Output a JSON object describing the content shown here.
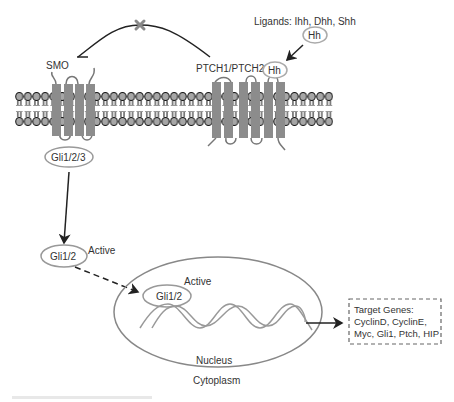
{
  "diagram": {
    "labels": {
      "smo": "SMO",
      "ptch": "PTCH1/PTCH2",
      "ligands": "Ligands: Ihh, Dhh, Shh",
      "hh_free": "Hh",
      "hh_bound": "Hh",
      "gli_membrane": "Gli1/2/3",
      "gli_cyto": "Gli1/2",
      "active_cyto": "Active",
      "gli_nucleus": "Gli1/2",
      "active_nucleus": "Active",
      "nucleus": "Nucleus",
      "cytoplasm": "Cytoplasm"
    },
    "target_genes": {
      "title": "Target Genes:",
      "line1": "CyclinD, CyclinE,",
      "line2": "Myc, Gli1, Ptch, HIP"
    },
    "inhibition_marker": "x-mark",
    "colors": {
      "line": "#222222",
      "receptor": "#8c8c8c",
      "lipid_head": "#9a9a9a",
      "outline": "#888888",
      "text": "#333333"
    }
  }
}
